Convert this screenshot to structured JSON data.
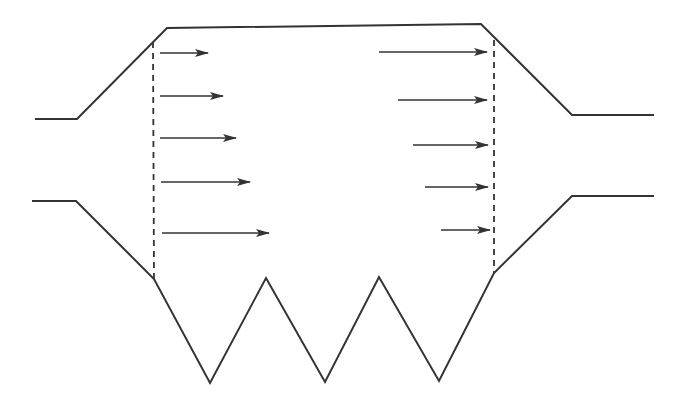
{
  "diagram": {
    "stroke_color": "#333333",
    "background": "#ffffff",
    "top_wall": [
      [
        35,
        119
      ],
      [
        77,
        119
      ],
      [
        167,
        28
      ],
      [
        481,
        24
      ],
      [
        572,
        115
      ],
      [
        654,
        115
      ]
    ],
    "bottom_wall": [
      [
        32,
        201
      ],
      [
        76,
        201
      ],
      [
        154,
        279
      ],
      [
        210,
        383
      ],
      [
        266,
        278
      ],
      [
        325,
        382
      ],
      [
        379,
        277
      ],
      [
        439,
        381
      ],
      [
        494,
        273
      ],
      [
        572,
        196
      ],
      [
        654,
        196
      ]
    ],
    "dashed_lines": [
      {
        "name": "inlet-section",
        "x1": 153,
        "y1": 42,
        "x2": 154,
        "y2": 279
      },
      {
        "name": "outlet-section",
        "x1": 494,
        "y1": 40,
        "x2": 494,
        "y2": 273
      }
    ],
    "inlet_arrows": [
      {
        "x1": 160,
        "y": 53,
        "x2": 208
      },
      {
        "x1": 160,
        "y": 96,
        "x2": 223
      },
      {
        "x1": 160,
        "y": 138,
        "x2": 236
      },
      {
        "x1": 161,
        "y": 182,
        "x2": 250
      },
      {
        "x1": 162,
        "y": 233,
        "x2": 269
      }
    ],
    "outlet_arrows": [
      {
        "x1": 379,
        "y": 52,
        "x2": 487
      },
      {
        "x1": 398,
        "y": 100,
        "x2": 487
      },
      {
        "x1": 413,
        "y": 145,
        "x2": 488
      },
      {
        "x1": 425,
        "y": 187,
        "x2": 488
      },
      {
        "x1": 441,
        "y": 230,
        "x2": 490
      }
    ]
  }
}
